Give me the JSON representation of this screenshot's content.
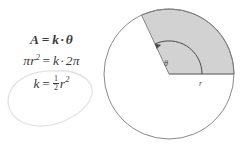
{
  "figure": {
    "background_color": "#ffffff"
  },
  "equations": {
    "line1": {
      "name": "area-proportional-to-angle",
      "lhs": "A",
      "rel": "=",
      "rhs_coefficient": "k",
      "operator": "·",
      "rhs_variable": "θ",
      "plain": "A = k · θ"
    },
    "line2": {
      "name": "full-circle-substitution",
      "lhs_base": "πr",
      "lhs_exponent": "2",
      "rel": "=",
      "rhs_coefficient": "k",
      "operator": "·",
      "rhs_variable": "2π",
      "plain": "πr² = k · 2π"
    },
    "line3": {
      "name": "solved-constant",
      "lhs": "k",
      "rel": "=",
      "fraction_numerator": "1",
      "fraction_denominator": "2",
      "rhs_base": "r",
      "rhs_exponent": "2",
      "plain": "k = ½ r²",
      "highlighted": true
    },
    "text_color": "#3c3c3c"
  },
  "annotation": {
    "name": "hand-drawn-loop",
    "shape": "hand-drawn-oval",
    "encircles": "line3",
    "stroke_color": "#e0e0e0"
  },
  "diagram": {
    "name": "circle-with-sector",
    "circle": {
      "center_x": 71,
      "center_y": 74,
      "radius": 65,
      "stroke_color": "#7a7a7a",
      "fill_color": "#ffffff"
    },
    "sector": {
      "start_angle_deg": 0,
      "end_angle_deg": 115,
      "fill_color": "#d2d2d2",
      "stroke_color": "#7a7a7a"
    },
    "radius_label": "r",
    "angle_label": "θ",
    "angle_arc": {
      "radius": 33,
      "arrowhead": "counterclockwise",
      "stroke_color": "#4a4a4a"
    },
    "label_color": "#4a4a4a"
  }
}
